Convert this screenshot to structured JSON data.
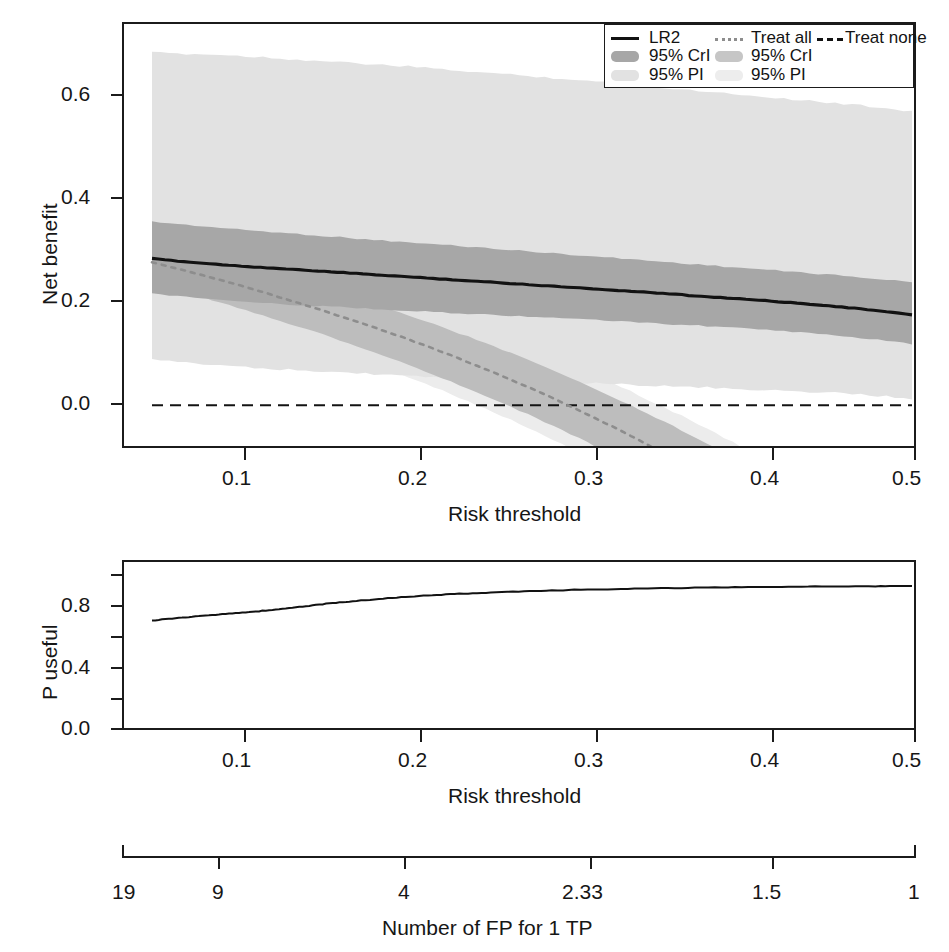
{
  "chart_data": [
    {
      "type": "line",
      "id": "decision-curve",
      "title": "",
      "xlabel": "Risk threshold",
      "ylabel": "Net benefit",
      "xlim": [
        0.05,
        0.5
      ],
      "ylim": [
        -0.075,
        0.7
      ],
      "xticks": [
        0.1,
        0.2,
        0.3,
        0.4,
        0.5
      ],
      "xtick_labels": [
        "0.1",
        "0.2",
        "0.3",
        "0.4",
        "0.5"
      ],
      "yticks": [
        0.0,
        0.2,
        0.4,
        0.6
      ],
      "ytick_labels": [
        "0.0",
        "0.2",
        "0.4",
        "0.6"
      ],
      "grid": false,
      "legend_position": "top-right",
      "x": [
        0.05,
        0.075,
        0.1,
        0.125,
        0.15,
        0.175,
        0.2,
        0.225,
        0.25,
        0.275,
        0.3,
        0.325,
        0.35,
        0.375,
        0.4,
        0.425,
        0.45,
        0.475,
        0.5
      ],
      "series": [
        {
          "name": "LR2",
          "style": "solid",
          "color": "#121212",
          "values": [
            0.269,
            0.262,
            0.256,
            0.251,
            0.246,
            0.241,
            0.236,
            0.231,
            0.226,
            0.221,
            0.216,
            0.211,
            0.206,
            0.2,
            0.195,
            0.189,
            0.183,
            0.175,
            0.166
          ]
        },
        {
          "name": "Treat all",
          "style": "dotted",
          "color": "#8d8d8d",
          "values": [
            0.262,
            0.243,
            0.222,
            0.199,
            0.175,
            0.15,
            0.123,
            0.094,
            0.063,
            0.03,
            -0.005,
            -0.043,
            -0.083,
            -0.127,
            -0.174,
            -0.225,
            -0.28,
            -0.34,
            -0.405
          ]
        },
        {
          "name": "Treat none",
          "style": "dashed",
          "color": "#131313",
          "values": [
            0.0,
            0.0,
            0.0,
            0.0,
            0.0,
            0.0,
            0.0,
            0.0,
            0.0,
            0.0,
            0.0,
            0.0,
            0.0,
            0.0,
            0.0,
            0.0,
            0.0,
            0.0,
            0.0
          ]
        }
      ],
      "bands": [
        {
          "name": "LR2 95% CrI",
          "color": "#a7a7a7",
          "upper": [
            0.337,
            0.33,
            0.323,
            0.317,
            0.311,
            0.305,
            0.299,
            0.294,
            0.288,
            0.282,
            0.276,
            0.27,
            0.264,
            0.258,
            0.252,
            0.246,
            0.24,
            0.233,
            0.226
          ],
          "lower": [
            0.205,
            0.197,
            0.191,
            0.186,
            0.182,
            0.178,
            0.174,
            0.17,
            0.166,
            0.162,
            0.158,
            0.154,
            0.15,
            0.146,
            0.141,
            0.136,
            0.13,
            0.122,
            0.112
          ]
        },
        {
          "name": "LR2 95% PI",
          "color": "#e2e2e2",
          "upper": [
            0.647,
            0.645,
            0.642,
            0.637,
            0.632,
            0.627,
            0.622,
            0.616,
            0.61,
            0.604,
            0.598,
            0.591,
            0.584,
            0.577,
            0.57,
            0.563,
            0.556,
            0.549,
            0.54
          ],
          "lower": [
            0.085,
            0.076,
            0.07,
            0.066,
            0.062,
            0.058,
            0.055,
            0.051,
            0.048,
            0.045,
            0.042,
            0.039,
            0.036,
            0.033,
            0.03,
            0.027,
            0.023,
            0.018,
            0.012
          ]
        },
        {
          "name": "Treat all 95% CrI",
          "color": "#bdbdbd",
          "upper": [
            0.3,
            0.282,
            0.262,
            0.24,
            0.217,
            0.193,
            0.167,
            0.14,
            0.111,
            0.08,
            0.047,
            0.012,
            -0.025,
            -0.064,
            -0.106,
            -0.151,
            -0.199,
            -0.25,
            -0.305
          ],
          "lower": [
            0.224,
            0.203,
            0.18,
            0.156,
            0.131,
            0.104,
            0.076,
            0.046,
            0.014,
            -0.02,
            -0.056,
            -0.095,
            -0.136,
            -0.18,
            -0.227,
            -0.278,
            -0.333,
            -0.392,
            -0.456
          ]
        },
        {
          "name": "Treat all 95% PI",
          "color": "#ececec",
          "upper": [
            0.312,
            0.296,
            0.277,
            0.257,
            0.235,
            0.212,
            0.187,
            0.161,
            0.133,
            0.103,
            0.071,
            0.037,
            0.001,
            -0.037,
            -0.078,
            -0.122,
            -0.169,
            -0.219,
            -0.273
          ],
          "lower": [
            0.208,
            0.186,
            0.162,
            0.137,
            0.111,
            0.083,
            0.054,
            0.023,
            -0.01,
            -0.045,
            -0.082,
            -0.122,
            -0.164,
            -0.209,
            -0.257,
            -0.309,
            -0.365,
            -0.425,
            -0.49
          ]
        }
      ],
      "legend": {
        "col1": [
          {
            "label": "LR2",
            "marker": "solid-line",
            "color": "#121212"
          },
          {
            "label": "95% CrI",
            "marker": "dark-swatch",
            "color": "#a7a7a7"
          },
          {
            "label": "95% PI",
            "marker": "light-swatch",
            "color": "#e2e2e2"
          }
        ],
        "col2": [
          {
            "label": "Treat all",
            "marker": "dotted-line",
            "color": "#8d8d8d"
          },
          {
            "label": "95% CrI",
            "marker": "mid-swatch",
            "color": "#c6c6c6"
          },
          {
            "label": "95% PI",
            "marker": "pale-swatch",
            "color": "#ededed"
          }
        ],
        "col3": [
          {
            "label": "Treat none",
            "marker": "dashed-line",
            "color": "#131313"
          }
        ]
      }
    },
    {
      "type": "line",
      "id": "p-useful",
      "title": "",
      "xlabel": "Risk threshold",
      "ylabel": "P useful",
      "xlim": [
        0.05,
        0.5
      ],
      "ylim": [
        0.0,
        1.0
      ],
      "xticks": [
        0.1,
        0.2,
        0.3,
        0.4,
        0.5
      ],
      "xtick_labels": [
        "0.1",
        "0.2",
        "0.3",
        "0.4",
        "0.5"
      ],
      "yticks": [
        0.0,
        0.2,
        0.4,
        0.6,
        0.8,
        1.0
      ],
      "ytick_labels": [
        "0.0",
        "",
        "0.4",
        "",
        "0.8",
        ""
      ],
      "grid": false,
      "x": [
        0.05,
        0.065,
        0.08,
        0.095,
        0.11,
        0.125,
        0.14,
        0.155,
        0.17,
        0.19,
        0.21,
        0.23,
        0.25,
        0.275,
        0.3,
        0.33,
        0.36,
        0.39,
        0.42,
        0.45,
        0.48,
        0.5
      ],
      "series": [
        {
          "name": "P useful",
          "style": "solid",
          "color": "#121212",
          "values": [
            0.695,
            0.712,
            0.727,
            0.742,
            0.755,
            0.772,
            0.792,
            0.812,
            0.828,
            0.848,
            0.864,
            0.877,
            0.886,
            0.897,
            0.905,
            0.912,
            0.918,
            0.922,
            0.926,
            0.928,
            0.93,
            0.931
          ]
        }
      ]
    }
  ],
  "panel1": {
    "y_title": "Net benefit",
    "x_title": "Risk threshold",
    "ytick_labels": [
      "0.6",
      "0.4",
      "0.2",
      "0.0"
    ],
    "xtick_labels": [
      "0.1",
      "0.2",
      "0.3",
      "0.4",
      "0.5"
    ]
  },
  "panel2": {
    "y_title": "P useful",
    "x_title": "Risk threshold",
    "ytick_labels": [
      "0.8",
      "0.4",
      "0.0"
    ],
    "xtick_labels": [
      "0.1",
      "0.2",
      "0.3",
      "0.4",
      "0.5"
    ]
  },
  "axis3": {
    "title": "Number of FP for 1 TP",
    "tick_labels": [
      "19",
      "9",
      "4",
      "2.33",
      "1.5",
      "1"
    ],
    "tick_values": [
      19,
      9,
      4,
      2.33,
      1.5,
      1
    ]
  },
  "legend": {
    "lr2": "LR2",
    "crl_1": "95% CrI",
    "pi_1": "95% PI",
    "treat_all": "Treat all",
    "crl_2": "95% CrI",
    "pi_2": "95% PI",
    "treat_none": "Treat none"
  },
  "colors": {
    "line": "#121212",
    "crl_band": "#a7a7a7",
    "pi_band": "#e2e2e2",
    "crl_band_all": "#c6c6c6",
    "pi_band_all": "#ededed",
    "axis": "#1b1b1b"
  }
}
